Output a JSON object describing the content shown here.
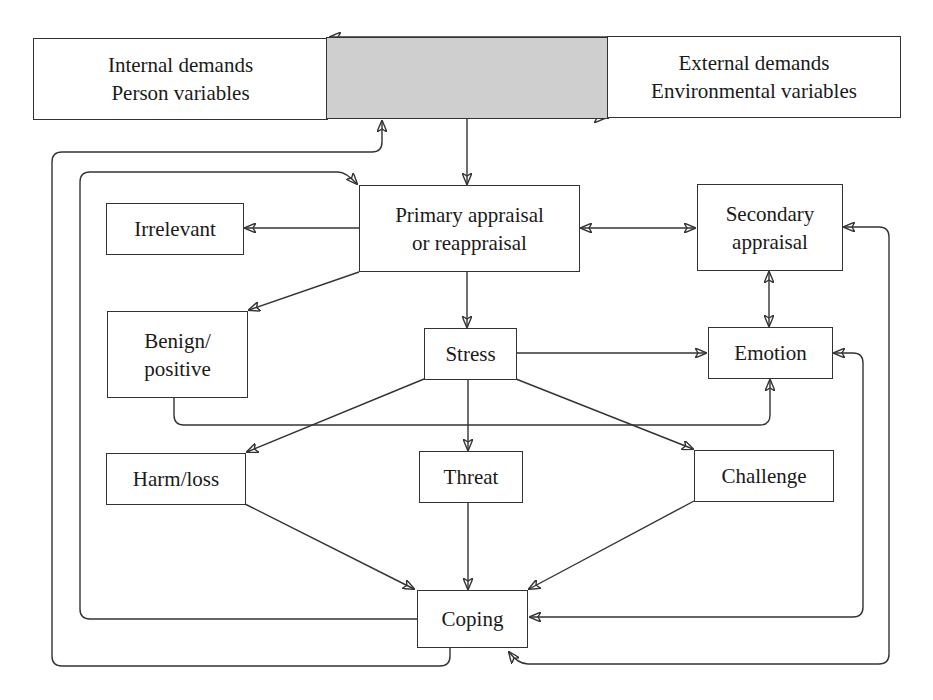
{
  "diagram": {
    "colors": {
      "line": "#333333",
      "box_fill": "#ffffff",
      "transaction_fill": "#cfcfcf"
    },
    "nodes": {
      "internal": {
        "line1": "Internal demands",
        "line2": "Person variables"
      },
      "transaction": {
        "label": ""
      },
      "external": {
        "line1": "External demands",
        "line2": "Environmental variables"
      },
      "irrelevant": {
        "label": "Irrelevant"
      },
      "primary": {
        "line1": "Primary appraisal",
        "line2": "or reappraisal"
      },
      "secondary": {
        "line1": "Secondary",
        "line2": "appraisal"
      },
      "benign": {
        "line1": "Benign/",
        "line2": "positive"
      },
      "stress": {
        "label": "Stress"
      },
      "emotion": {
        "label": "Emotion"
      },
      "harm": {
        "label": "Harm/loss"
      },
      "threat": {
        "label": "Threat"
      },
      "challenge": {
        "label": "Challenge"
      },
      "coping": {
        "label": "Coping"
      }
    },
    "edges": [
      {
        "from": "external",
        "to": "internal",
        "type": "arrow"
      },
      {
        "from": "internal",
        "to": "external",
        "type": "arrow"
      },
      {
        "from": "transaction",
        "to": "primary",
        "type": "arrow"
      },
      {
        "from": "primary",
        "to": "irrelevant",
        "type": "arrow"
      },
      {
        "from": "primary",
        "to": "secondary",
        "type": "bidirectional"
      },
      {
        "from": "primary",
        "to": "benign",
        "type": "arrow"
      },
      {
        "from": "primary",
        "to": "stress",
        "type": "arrow"
      },
      {
        "from": "secondary",
        "to": "emotion",
        "type": "bidirectional"
      },
      {
        "from": "stress",
        "to": "emotion",
        "type": "arrow"
      },
      {
        "from": "benign",
        "to": "emotion",
        "type": "arrow"
      },
      {
        "from": "stress",
        "to": "harm",
        "type": "arrow"
      },
      {
        "from": "stress",
        "to": "threat",
        "type": "arrow"
      },
      {
        "from": "stress",
        "to": "challenge",
        "type": "arrow"
      },
      {
        "from": "harm",
        "to": "coping",
        "type": "arrow"
      },
      {
        "from": "threat",
        "to": "coping",
        "type": "arrow"
      },
      {
        "from": "challenge",
        "to": "coping",
        "type": "arrow"
      },
      {
        "from": "coping",
        "to": "primary",
        "type": "feedback-arrow"
      },
      {
        "from": "coping",
        "to": "transaction",
        "type": "feedback-arrow"
      },
      {
        "from": "emotion",
        "to": "coping",
        "type": "bidirectional-loop"
      },
      {
        "from": "secondary",
        "to": "coping",
        "type": "bidirectional-loop"
      }
    ]
  }
}
